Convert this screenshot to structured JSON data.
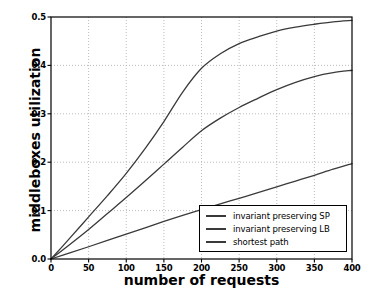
{
  "chart_data": {
    "type": "line",
    "title": "",
    "xlabel": "number of requests",
    "ylabel": "middleboxes utilization",
    "xlim": [
      0,
      400
    ],
    "ylim": [
      0.0,
      0.5
    ],
    "xticks": [
      0,
      50,
      100,
      150,
      200,
      250,
      300,
      350,
      400
    ],
    "xtick_labels": [
      "0",
      "50",
      "100",
      "150",
      "200",
      "250",
      "300",
      "350",
      "400"
    ],
    "yticks": [
      0.0,
      0.1,
      0.2,
      0.3,
      0.4,
      0.5
    ],
    "ytick_labels": [
      "0.0",
      "0.1",
      "0.2",
      "0.3",
      "0.4",
      "0.5"
    ],
    "grid": true,
    "grid_style": "dotted",
    "grid_color": "#b4b4b4",
    "legend_position": "lower right",
    "x": [
      0,
      25,
      50,
      75,
      100,
      125,
      150,
      175,
      200,
      225,
      250,
      275,
      300,
      325,
      350,
      375,
      400
    ],
    "series": [
      {
        "name": "invariant preserving SP",
        "color": "#3a3a3a",
        "values": [
          0.0,
          0.043,
          0.087,
          0.131,
          0.177,
          0.228,
          0.284,
          0.345,
          0.394,
          0.424,
          0.445,
          0.459,
          0.471,
          0.479,
          0.485,
          0.49,
          0.493
        ]
      },
      {
        "name": "invariant preserving LB",
        "color": "#3a3a3a",
        "values": [
          0.0,
          0.03,
          0.061,
          0.094,
          0.127,
          0.161,
          0.196,
          0.231,
          0.265,
          0.291,
          0.313,
          0.332,
          0.35,
          0.365,
          0.377,
          0.385,
          0.39
        ]
      },
      {
        "name": "shortest path",
        "color": "#3a3a3a",
        "values": [
          0.0,
          0.0125,
          0.0253,
          0.0383,
          0.0515,
          0.0645,
          0.0775,
          0.09,
          0.102,
          0.114,
          0.1255,
          0.137,
          0.149,
          0.161,
          0.173,
          0.1855,
          0.197
        ]
      }
    ]
  },
  "axes": {
    "frame_color": "#000000",
    "background": "#ffffff"
  },
  "legend": {
    "items": [
      {
        "label": "invariant preserving SP"
      },
      {
        "label": "invariant preserving LB"
      },
      {
        "label": "shortest path"
      }
    ]
  }
}
